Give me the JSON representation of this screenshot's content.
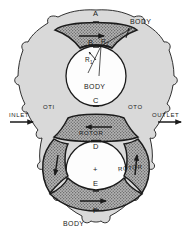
{
  "figure": {
    "background_color": "#ffffff",
    "line_color": "#1b1b1b",
    "body_fill_color": "#d9d9d9",
    "lobe_fill_color": "#a8a8a8",
    "chamber_fill_color": "#fdfdfd"
  },
  "labels": {
    "point_a": "A",
    "point_b": "B",
    "point_c": "C",
    "point_d": "D",
    "point_e": "E",
    "point_f": "F",
    "body_top": "BODY",
    "body_center": "BODY",
    "body_bottom": "BODY",
    "rotor_upper": "ROTOR",
    "rotor_lower": "ROTOR",
    "inlet": "INLET",
    "outlet": "OUTLET",
    "oti": "OTI",
    "oto": "OTO",
    "radius_inner": "R",
    "radius_inner_sub": "1",
    "radius_outer": "R",
    "radius_outer_sub": "2",
    "center_mark": "+"
  },
  "icons": {
    "inlet_arrow": "arrow-right-icon",
    "outlet_arrow": "arrow-right-icon",
    "top_lobe_arrow": "arrow-right-icon",
    "upper_rotor_arrow": "arrow-left-icon",
    "bottom_lobe_arrow": "arrow-right-icon",
    "left_lobe_arrow": "arrow-down-icon",
    "right_lobe_arrow": "arrow-up-icon",
    "radius_pointer_inner": "arrow-pointer-icon",
    "radius_pointer_outer": "arrow-pointer-icon"
  }
}
